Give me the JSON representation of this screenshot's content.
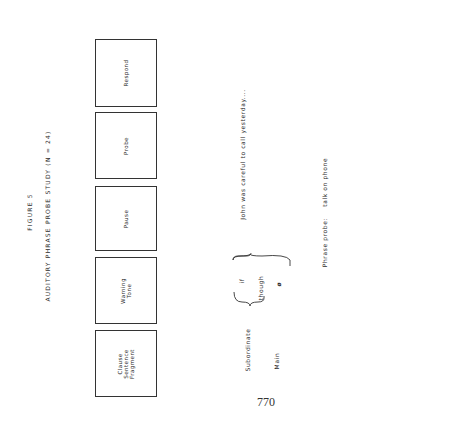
{
  "figure": {
    "label": "FIGURE 5",
    "title": "AUDITORY PHRASE PROBE STUDY (N = 24)"
  },
  "sequence_boxes": [
    {
      "lines": [
        "Clause",
        "Sentence",
        "Fragment"
      ]
    },
    {
      "lines": [
        "Warning",
        "Tone"
      ]
    },
    {
      "lines": [
        "Pause"
      ]
    },
    {
      "lines": [
        "Probe"
      ]
    },
    {
      "lines": [
        "Respond"
      ]
    }
  ],
  "clause_types": {
    "subordinate_label": "Subordinate",
    "main_label": "Main",
    "subordinate_connective": "if",
    "main_connective_options": [
      "though",
      "ø"
    ],
    "sentence": "John was careful to call yesterday...."
  },
  "phrase_probe": {
    "label": "Phrase probe:",
    "value": "talk on phone"
  },
  "page_number": "770",
  "colors": {
    "ink": "#2a2a2a",
    "background": "#ffffff"
  }
}
